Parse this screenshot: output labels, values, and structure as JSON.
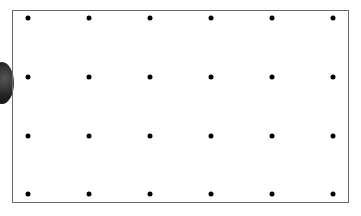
{
  "diagram": {
    "type": "dot-grid",
    "rows": 4,
    "columns": 6,
    "frame": {
      "left": 12,
      "top": 10,
      "right": 349,
      "bottom": 203,
      "border_color": "#6a6a6a"
    },
    "dot_color": "#000000",
    "column_x": [
      28,
      89,
      150,
      211,
      272,
      333
    ],
    "row_y": [
      18,
      77,
      136,
      194
    ],
    "decoration": "dark-rounded-object-left-edge"
  }
}
